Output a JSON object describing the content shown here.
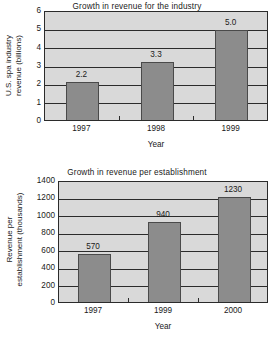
{
  "chart_data": [
    {
      "id": "top",
      "type": "bar",
      "title": "Growth in revenue for the industry",
      "xlabel": "Year",
      "ylabel": "U.S. spa industry revenue (billions)",
      "ylabel_lines": [
        "U.S. spa industry",
        "revenue (billions)"
      ],
      "categories": [
        "1997",
        "1998",
        "1999"
      ],
      "values": [
        2.2,
        3.3,
        5.0
      ],
      "data_labels": [
        "2.2",
        "3.3",
        "5.0"
      ],
      "yticks": [
        "6",
        "5",
        "4",
        "3",
        "2",
        "1",
        "0"
      ],
      "ytick_values": [
        6,
        5,
        4,
        3,
        2,
        1,
        0
      ],
      "ylim": [
        0,
        6
      ],
      "grid": true,
      "legend": "none",
      "bar_color": "#8c8c8c",
      "plot_background": "#d9d9d9",
      "axis_color": "#2b2b2b"
    },
    {
      "id": "bottom",
      "type": "bar",
      "title": "Growth in revenue per establishment",
      "xlabel": "Year",
      "ylabel": "Revenue per establishment (thousands)",
      "ylabel_lines": [
        "Revenue per",
        "establishment (thousands)"
      ],
      "categories": [
        "1997",
        "1999",
        "2000"
      ],
      "values": [
        570,
        940,
        1230
      ],
      "data_labels": [
        "570",
        "940",
        "1230"
      ],
      "yticks": [
        "1400",
        "1200",
        "1000",
        "800",
        "600",
        "400",
        "200",
        "0"
      ],
      "ytick_values": [
        1400,
        1200,
        1000,
        800,
        600,
        400,
        200,
        0
      ],
      "ylim": [
        0,
        1400
      ],
      "grid": true,
      "legend": "none",
      "bar_color": "#8c8c8c",
      "plot_background": "#d9d9d9",
      "axis_color": "#2b2b2b"
    }
  ]
}
